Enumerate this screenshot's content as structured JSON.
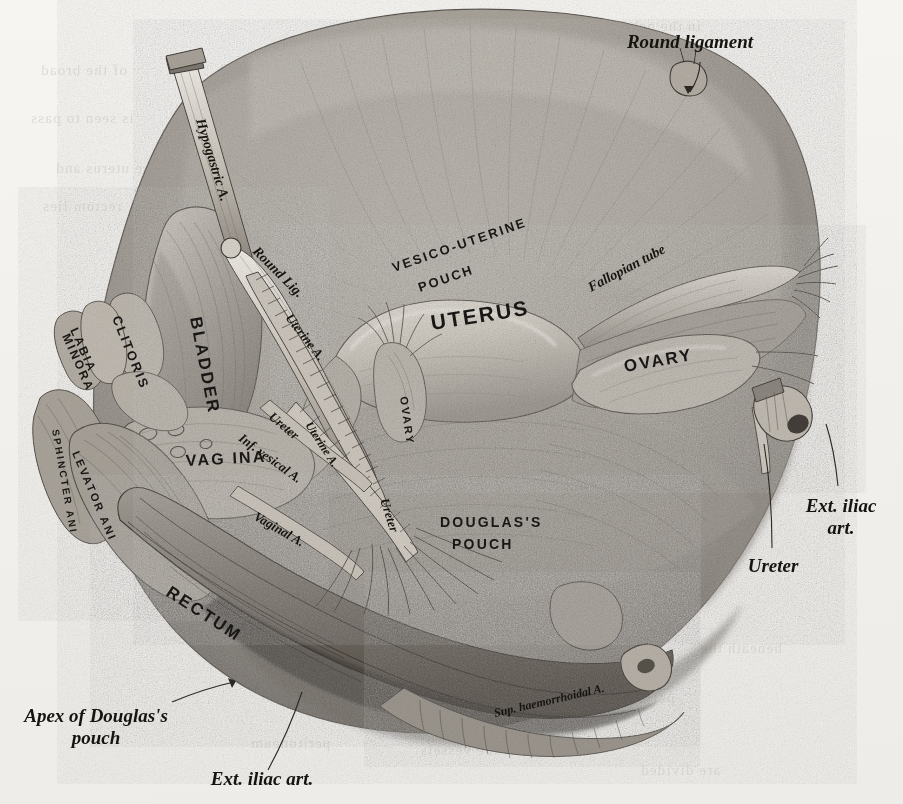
{
  "plate": {
    "title": "Female pelvic viscera seen from above and in front",
    "medium": "halftone engraving",
    "background_color": "#f2f0ec",
    "ink_color": "#1b1a18"
  },
  "outside_labels": [
    {
      "id": "round-ligament",
      "text": "Round ligament",
      "style": "italic-serif",
      "x": 690,
      "y": 48,
      "anchor": "middle",
      "leader": true
    },
    {
      "id": "ext-iliac-art-right",
      "text": "Ext. iliac",
      "text2": "art.",
      "style": "italic-serif",
      "x": 841,
      "y": 512,
      "anchor": "middle",
      "leader": true
    },
    {
      "id": "ureter-right",
      "text": "Ureter",
      "style": "italic-serif",
      "x": 773,
      "y": 572,
      "anchor": "middle",
      "leader": true
    },
    {
      "id": "apex-douglas-pouch",
      "text": "Apex of Douglas's",
      "text2": "pouch",
      "style": "italic-serif",
      "x": 96,
      "y": 722,
      "anchor": "middle",
      "leader": true
    },
    {
      "id": "ext-iliac-art-bottom",
      "text": "Ext. iliac art.",
      "style": "italic-serif",
      "x": 262,
      "y": 785,
      "anchor": "middle",
      "leader": true
    }
  ],
  "organ_labels": [
    {
      "id": "uterus",
      "text": "UTERUS",
      "style": "caps",
      "x": 432,
      "y": 330,
      "rotate": -9,
      "size": 21
    },
    {
      "id": "ovary-right",
      "text": "OVARY",
      "style": "caps",
      "x": 625,
      "y": 372,
      "rotate": -10,
      "size": 17
    },
    {
      "id": "ovary-left",
      "text": "OVARY",
      "style": "caps",
      "x": 400,
      "y": 397,
      "rotate": 82,
      "size": 11
    },
    {
      "id": "bladder",
      "text": "BLADDER",
      "style": "caps",
      "x": 190,
      "y": 318,
      "rotate": 79,
      "size": 17
    },
    {
      "id": "vagina",
      "text": "VAG INA",
      "style": "caps",
      "x": 186,
      "y": 466,
      "rotate": -3,
      "size": 16
    },
    {
      "id": "rectum",
      "text": "RECTUM",
      "style": "caps",
      "x": 165,
      "y": 595,
      "rotate": 33,
      "size": 17
    },
    {
      "id": "clitoris",
      "text": "CLITORIS",
      "style": "caps",
      "x": 112,
      "y": 318,
      "rotate": 68,
      "size": 13
    },
    {
      "id": "labia-minora-1",
      "text": "LABIA",
      "style": "caps",
      "x": 70,
      "y": 330,
      "rotate": 66,
      "size": 12
    },
    {
      "id": "labia-minora-2",
      "text": "MINORA",
      "style": "caps",
      "x": 62,
      "y": 336,
      "rotate": 66,
      "size": 12
    },
    {
      "id": "sphincter-ani",
      "text": "SPHINCTER ANI",
      "style": "caps",
      "x": 52,
      "y": 430,
      "rotate": 80,
      "size": 10
    },
    {
      "id": "levator-ani",
      "text": "LEVATOR ANI",
      "style": "caps",
      "x": 72,
      "y": 453,
      "rotate": 67,
      "size": 11
    },
    {
      "id": "vesico-uterine-pouch-1",
      "text": "VESICO-UTERINE",
      "style": "caps",
      "x": 394,
      "y": 272,
      "rotate": -19,
      "size": 13
    },
    {
      "id": "vesico-uterine-pouch-2",
      "text": "POUCH",
      "style": "caps",
      "x": 420,
      "y": 292,
      "rotate": -19,
      "size": 13
    },
    {
      "id": "douglas-pouch-1",
      "text": "DOUGLAS'S",
      "style": "caps",
      "x": 440,
      "y": 527,
      "rotate": 0,
      "size": 14
    },
    {
      "id": "douglas-pouch-2",
      "text": "POUCH",
      "style": "caps",
      "x": 452,
      "y": 549,
      "rotate": 0,
      "size": 14
    }
  ],
  "vessel_labels": [
    {
      "id": "hypogastric-artery",
      "text": "Hypogastric A.",
      "style": "italic-serif",
      "x": 196,
      "y": 120,
      "rotate": 73,
      "size": 14
    },
    {
      "id": "round-lig-inner",
      "text": "Round Lig.",
      "style": "italic-serif",
      "x": 252,
      "y": 252,
      "rotate": 45,
      "size": 14
    },
    {
      "id": "uterine-artery-upper",
      "text": "Uterine A.",
      "style": "italic-serif",
      "x": 285,
      "y": 318,
      "rotate": 52,
      "size": 13
    },
    {
      "id": "ureter-left-upper",
      "text": "Ureter",
      "style": "italic-serif",
      "x": 268,
      "y": 418,
      "rotate": 40,
      "size": 13
    },
    {
      "id": "uterine-artery-lower",
      "text": "Uterine A.",
      "style": "italic-serif",
      "x": 305,
      "y": 425,
      "rotate": 57,
      "size": 12
    },
    {
      "id": "inf-vesical-artery",
      "text": "Inf. vesical A.",
      "style": "italic-serif",
      "x": 238,
      "y": 440,
      "rotate": 36,
      "size": 13
    },
    {
      "id": "vaginal-artery",
      "text": "Vaginal A.",
      "style": "italic-serif",
      "x": 253,
      "y": 519,
      "rotate": 30,
      "size": 13
    },
    {
      "id": "ureter-left-lower",
      "text": "Ureter",
      "style": "italic-serif",
      "x": 380,
      "y": 500,
      "rotate": 72,
      "size": 13
    },
    {
      "id": "fallopian-tube",
      "text": "Fallopian tube",
      "style": "italic-serif",
      "x": 591,
      "y": 292,
      "rotate": -28,
      "size": 14
    },
    {
      "id": "sup-haemorrhoidal-artery",
      "text": "Sup. haemorrhoidal A.",
      "style": "italic-serif",
      "x": 495,
      "y": 717,
      "rotate": -13,
      "size": 12
    }
  ],
  "bleed_through": [
    {
      "text": "in the pelvis",
      "x": 612,
      "y": 18
    },
    {
      "text": "of the broad",
      "x": 40,
      "y": 62
    },
    {
      "text": "is seen to pass",
      "x": 30,
      "y": 110
    },
    {
      "text": "the uterus and",
      "x": 55,
      "y": 160
    },
    {
      "text": "rectum lies",
      "x": 42,
      "y": 198
    },
    {
      "text": "beneath the",
      "x": 700,
      "y": 640
    },
    {
      "text": "pelvic floor and",
      "x": 560,
      "y": 690
    },
    {
      "text": "the vessels",
      "x": 420,
      "y": 742
    },
    {
      "text": "are divided",
      "x": 640,
      "y": 762
    },
    {
      "text": "peritoneum",
      "x": 250,
      "y": 735
    }
  ]
}
